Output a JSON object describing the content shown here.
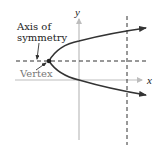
{
  "diagram": {
    "type": "parabola-horizontal",
    "labels": {
      "x_axis": "x",
      "y_axis": "y",
      "axis_of_symmetry": [
        "Axis of",
        "symmetry"
      ],
      "vertex": "Vertex"
    },
    "colors": {
      "axes": "#bdbdbd",
      "curve": "#333333",
      "dashed": "#333333",
      "text": "#222222",
      "vertex_label": "#777777"
    },
    "geometry": {
      "vertex": [
        49,
        61
      ],
      "y_axis_x": 79,
      "x_axis_y": 80,
      "symmetry_line_y": 61,
      "vertical_dashed_x": 127
    }
  }
}
